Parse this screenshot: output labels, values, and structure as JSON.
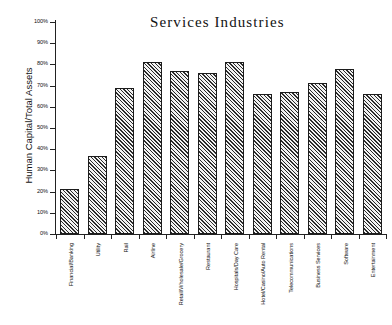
{
  "chart_data": {
    "type": "bar",
    "title": "Services Industries",
    "xlabel": "",
    "ylabel": "Human Capital/Total Assets",
    "ylim": [
      0,
      100
    ],
    "yunit": "%",
    "grid": false,
    "legend": null,
    "ytick_labels": [
      "100%",
      "90%",
      "80%",
      "70%",
      "60%",
      "50%",
      "40%",
      "30%",
      "20%",
      "10%",
      "0%"
    ],
    "ytick_values": [
      100,
      90,
      80,
      70,
      60,
      50,
      40,
      30,
      20,
      10,
      0
    ],
    "categories": [
      "Financial/Banking",
      "Utility",
      "Rail",
      "Airline",
      "Retail/Wholesale/Grocery",
      "Restaurant",
      "Hospitals/Day Care",
      "Hotel/Casino/Auto Rental",
      "Telecommunications",
      "Business Services",
      "Software",
      "Entertainment"
    ],
    "values": [
      21,
      37,
      69,
      81,
      77,
      76,
      81,
      66,
      67,
      71,
      78,
      66
    ]
  },
  "colors": {
    "axis": "#222222",
    "bar_outline": "#1c1c1c",
    "bar_hatch": "#2b2b2b",
    "bar_background": "#f2f2f2",
    "text": "#111111",
    "page_background": "#ffffff"
  }
}
